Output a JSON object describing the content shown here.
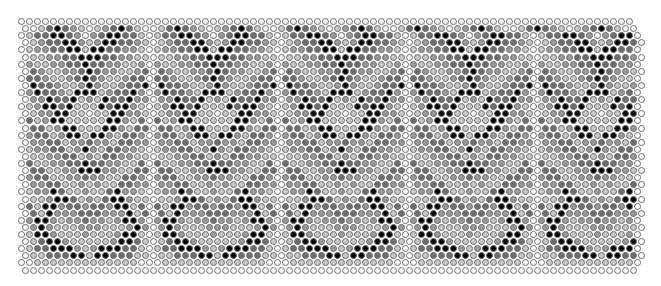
{
  "grid": {
    "columns": 77,
    "rows": 36,
    "pitch_x": 8,
    "pitch_y": 7.1,
    "bead_size": 7
  },
  "palette": {
    "W": "#ffffff",
    "L": "#c8c8c8",
    "M": "#9a9a9a",
    "D": "#6e6e6e",
    "K": "#000000"
  },
  "rows": [
    "WWWWWWWWWWWWWWWWWWWWWWWWWWWWWWWWWWWWWWWWWWWWWWWWWWWWWWWWWWWWWWWWWWWWWWWWWWWWW",
    "WWLDKDMLWLMDKDLWWLDKDMLWLMDKDLWWLDKDMLWLMDKDLWWLDKDMLWLMDKDLWWLDKDMLWLMDKDLWW",
    "WLDDKKDMWMDKKDDLWLDDKKDMWMDKKDDLWLDDKKDMWMDKKDDLWLDDKKDMWMDKKDDLWLDDKKDMWMDKKW",
    "WLMDDKKMLMKKDDMLWLMDDKKMLMKKDDMLWLMDDKKMLMKKDDMLWLMDDKKMLMKKDDMLWLMDDKKMLMKKDW",
    "WLMMDDKKLKKDDMMLWLMMDDKKLKKDDMMLWLMMDDKKLKKDDMMLWLMMDDKKLKKDDMMLWLMMDDKKLKKDDW",
    "WLLMMDDKKKDDMMLLWLLMMDDKKKDDMMLLWLLMMDDKKKDDMMLLWLLMMDDKKKDDMMLLWLLMMDDKKKDDMW",
    "WMLLMMDDKDDMMLLMWMLLMMDDKDDMMLLMWMLLMMDDKDDMMLLMWMLLMMDDKDDMMLLMWMLLMMDDKDDMMW",
    "WDMLLMMDKDMMLLMDWDMLLMMDKDMMLLMDWDMLLMMDKDMMLLMDWDMLLMMDKDMMLLMDWDMLLMMDKDMMLW",
    "WDDMLLMDKDMLLMDDWDDMLLMDKDMLLMDDWDDMLLMDKDMLLMDDWDDMLLMDKDMLLMDDWDDMLLMDKDMLLW",
    "WKDDMLLMKMLLMDDKWKDDMLLMKMLLMDDKWKDDMLLMKMLLMDDKWKDDMLLMKMLLMDDKWKDDMLLMKMLLMW",
    "WMKDDMLKKKLMDDKMWMKDDMLKKKLMDDKMWMKDDMLKKKLMDDKMWMKDDMLKKKLMDDKMWMKDDMLKKKLMDW",
    "WMMKDDKLMLKDDKMMWMMKDDKLMLKDDKMMWMMKDDKLMLKDDKMMWMMKDDKLMLKDDKMMWMMKDDKLMLKDDW",
    "WLMKKDKLLLKDKKMLWLMKKDKLLLKDKKMLWLMKKDKLLLKDKKMLWLMKKDKLLLKDKKMLWLMKKDKLLLKDKW",
    "WLMMKKLLWLLKKMMLWLMMKKLLWLLKKMMLWLMMKKLLWLLKKMMLWLMMKKLLWLLKKMMLWLMMKKLLWLLKKW",
    "WDLMKKLLLLLKKMLDWDLMKKLLLLLKKMLDWDLMKKLLLLLKKMLDWDLMKKLLLLLKKMLDWDLMKKLLLLLKKW",
    "WDDLMKKLLLKKMLDDWDDLMKKLLLKKMLDDWDDLMKKLLLKKMLDDWDDLMKKLLLKKMLDDWDDLMKKLLLKKMW",
    "WMDDLMKKLKKMLDDMWMDDLMKKLKKMLDDMWMDDLMKKLKKMLDDMWMDDLMKKLKKMLDDMWMDDLMKKLKKMLW",
    "WMMDDLMMDMMLDDMMWMMDDLMMDMMLDDMMWMMDDLMMDMMLDDMMWMMDDLMMDMMLDDMMWMMDDLMMDMMLDW",
    "WLMMDDLMKMLDDMMLWLMMDDLMKMLDDMMLWLMMDDLMKMLDDMMLWLMMDDLMKMLDDMMLWLMMDDLMKMLDDW",
    "WLLMMDDLMLDDMMLLWLLMMDDLMLDDMMLLWLLMMDDLMLDDMMLLWLLMMDDLMLDDMMLLWLLMMDDLMLDDMW",
    "WDLLMMDDKDDMMLLDWDLLMMDDKDDMMLLDWDLLMMDDKDDMMLLDWDLLMMDDKDDMMLLDWDLLMMDDKDDMMW",
    "WDDLLMMKKKMMLLDDWDDLLMMKKKMMLLDDWDDLLMMKKKMMLLDDWDDLLMMKKKMMLLDDWDDLLMMKKKMMLW",
    "WMDDLLMMDMMLLDDMWMDDLLMMDMMLLDDMWMDDLLMMDMMLLDDMWMDDLLMMDMMLLDDMWMDDLLMMDMMLLW",
    "WMMDDLLMLMLLDDMMWMMDDLLMLMLLDDMMWMMDDLLMLMLLDDMMWMMDDLLMLMLLDDMMWMMDDLLMLMLLDW",
    "WLMMKDLLMLLDKMMLWLMMKDLLMLLDKMMLWLMMKDLLMLLDKMMLWLMMKDLLMLLDKMMLWLMMKDLLMLLDKW",
    "WLLMKKDLMLDKKMLLWLLMKKDLMLDKKMLLWLLMKKDLMLDKKMLLWLLMKKDLMLDKKMLLWLLMKKDLMLDKKW",
    "WDLKKMDDMDDMKKLDWDLKKMDDMDDMKKLDWDLKKMDDMDDMKKLDWDLKKMDDMDDMKKLDWDLKKMDDMDDMKW",
    "WDLKMMMDDDMMMKLDWDLKMMMDDDMMMKLDWDLKMMMDDDMMMKLDWDLKMMMDDDMMMKLDWDLKMMMDDDMMMW",
    "WMKKMLMMDMMLMKKMWMKKMLMMDMMLMKKMWMKKMLMMDMMLMKKMWMKKMLMMDMMLMKKMWMKKMLMMDMMLMW",
    "WMKMLLLMMMLLLMKMWMKMLLLMMMLLLMKMWMKMLLLMMMLLLMKMWMKMLLLMMMLLLMKMWMKMLLLMMMLLLW",
    "WLKKMLLLMLLLMKKLWLKKMLLLMLLLMKKLWLKKMLLLMLLLMKKLWLKKMLLLMLLLMKKLWLKKMLLLMLLLMW",
    "WLDKKMLLLLLMKKDLWLDKKMLLLLLMKKDLWLDKKMLLLLLMKKDLWLDKKMLLLLLMKKDLWLDKKMLLLLLMKW",
    "WLDDKKKMLMKKKDDLWLDDKKKMLMKKKDDLWLDDKKKMLMKKKDDLWLDDKKKMLMKKKDDLWLDDKKKMLMKKKW",
    "WLLDDDKKLKKDDDLLWLLDDDKKLKKDDDLLWLLDDDKKLKKDDDLLWLLDDDKKLKKDDDLLWLLDDDKKLKKDDW",
    "WWLLLLLLLLLLLLLWWWLLLLLLLLLLLLLWWWLLLLLLLLLLLLLWWWLLLLLLLLLLLLLWWWLLLLLLLLLLLW",
    "WWWWWWWWWWWWWWWWWWWWWWWWWWWWWWWWWWWWWWWWWWWWWWWWWWWWWWWWWWWWWWWWWWWWWWWWWWWWW"
  ]
}
